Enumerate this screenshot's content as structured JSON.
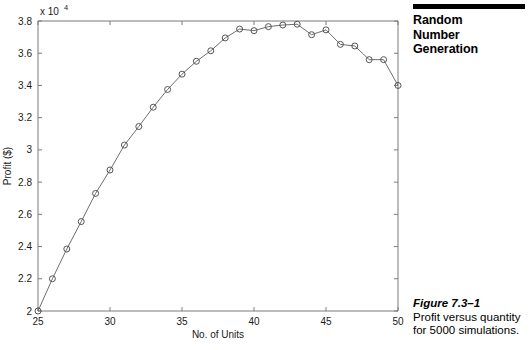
{
  "running_head": {
    "title": "Random\nNumber\nGeneration"
  },
  "caption": {
    "label": "Figure 7.3–1",
    "text": "Profit versus quantity for 5000 simulations."
  },
  "chart_data": {
    "type": "line",
    "title": "",
    "xlabel": "No. of Units",
    "ylabel": "Profit ($)",
    "y_exponent_mantissa": "x 10",
    "y_exponent_power": "4",
    "y_scale": 10000,
    "xlim": [
      25,
      50
    ],
    "ylim": [
      2,
      3.8
    ],
    "xticks": [
      25,
      30,
      35,
      40,
      45,
      50
    ],
    "xticklabels": [
      "25",
      "30",
      "35",
      "40",
      "45",
      "50"
    ],
    "yticks": [
      2,
      2.2,
      2.4,
      2.6,
      2.8,
      3,
      3.2,
      3.4,
      3.6,
      3.8
    ],
    "yticklabels": [
      "2",
      "2.2",
      "2.4",
      "2.6",
      "2.8",
      "3",
      "3.2",
      "3.4",
      "3.6",
      "3.8"
    ],
    "grid": false,
    "legend": false,
    "marker": "circle",
    "line_color": "#6e6e6e",
    "marker_color": "#555555",
    "axis_color": "#7b7b7b",
    "x": [
      25,
      26,
      27,
      28,
      29,
      30,
      31,
      32,
      33,
      34,
      35,
      36,
      37,
      38,
      39,
      40,
      41,
      42,
      43,
      44,
      45,
      46,
      47,
      48,
      49,
      50
    ],
    "values": [
      2.0,
      2.2,
      2.385,
      2.555,
      2.73,
      2.875,
      3.03,
      3.145,
      3.265,
      3.375,
      3.47,
      3.55,
      3.615,
      3.695,
      3.75,
      3.74,
      3.765,
      3.775,
      3.78,
      3.715,
      3.745,
      3.655,
      3.645,
      3.56,
      3.56,
      3.4
    ]
  }
}
